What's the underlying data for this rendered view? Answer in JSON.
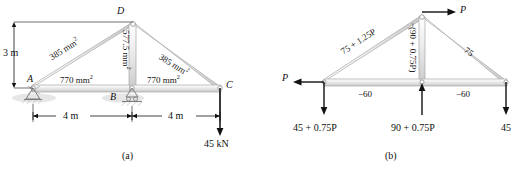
{
  "figure_a": {
    "caption": "(a)",
    "joints": [
      {
        "name": "A",
        "x": 0,
        "y": 0
      },
      {
        "name": "B",
        "x": 4,
        "y": 0
      },
      {
        "name": "C",
        "x": 8,
        "y": 0
      },
      {
        "name": "D",
        "x": 4,
        "y": 3
      }
    ],
    "members": [
      {
        "from": "A",
        "to": "D",
        "area_label": "385 mm",
        "area_unit_exp": "2"
      },
      {
        "from": "D",
        "to": "C",
        "area_label": "385 mm",
        "area_unit_exp": "2"
      },
      {
        "from": "A",
        "to": "B",
        "area_label": "770 mm",
        "area_unit_exp": "2"
      },
      {
        "from": "B",
        "to": "C",
        "area_label": "770 mm",
        "area_unit_exp": "2"
      },
      {
        "from": "B",
        "to": "D",
        "area_label": "577.5 mm",
        "area_unit_exp": "2"
      }
    ],
    "dimensions": {
      "height": "3 m",
      "span_left": "4 m",
      "span_right": "4 m"
    },
    "load": {
      "label": "45 kN",
      "at_joint": "C",
      "direction": "down"
    },
    "supports": [
      {
        "at_joint": "A",
        "type": "pin"
      },
      {
        "at_joint": "B",
        "type": "roller"
      }
    ]
  },
  "figure_b": {
    "caption": "(b)",
    "member_forces": [
      {
        "member": "A-D",
        "label": "75 + 1.25P"
      },
      {
        "member": "D-C",
        "label": "75"
      },
      {
        "member": "A-B",
        "label": "−60"
      },
      {
        "member": "B-C",
        "label": "−60"
      },
      {
        "member": "B-D",
        "label": "−(90 + 0.75P)"
      }
    ],
    "applied_loads": [
      {
        "at_joint": "A",
        "label": "P",
        "direction": "left"
      },
      {
        "at_joint": "D",
        "label": "P",
        "direction": "right"
      }
    ],
    "reactions": [
      {
        "at_joint": "A",
        "label": "45 + 0.75P",
        "direction": "down"
      },
      {
        "at_joint": "B",
        "label": "90 + 0.75P",
        "direction": "up"
      },
      {
        "at_joint": "C",
        "label": "45",
        "direction": "down"
      }
    ]
  },
  "colors": {
    "member_fill_light": "#f2f2f2",
    "member_fill_mid": "#d8d8d8",
    "member_stroke": "#9a9a9a",
    "line": "#111111",
    "ground_hatch": "#cfcfcf"
  }
}
